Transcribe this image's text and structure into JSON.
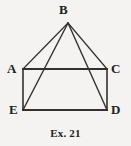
{
  "figure": {
    "caption": "Ex. 21",
    "background_color": "#f4f3f1",
    "stroke_color": "#33302e",
    "label_color": "#201e1d",
    "width": 131,
    "height": 146,
    "vertices": [
      {
        "id": "B",
        "label": "B",
        "x": 68,
        "y": 23
      },
      {
        "id": "A",
        "label": "A",
        "x": 23,
        "y": 69
      },
      {
        "id": "C",
        "label": "C",
        "x": 107,
        "y": 69
      },
      {
        "id": "E",
        "label": "E",
        "x": 23,
        "y": 110
      },
      {
        "id": "D",
        "label": "D",
        "x": 107,
        "y": 110
      }
    ],
    "segments": [
      {
        "id": "AC",
        "from": "A",
        "to": "C",
        "role": "rectangle-top-edge",
        "weight": 2.0
      },
      {
        "id": "CD",
        "from": "C",
        "to": "D",
        "role": "rectangle-right-edge",
        "weight": 1.6
      },
      {
        "id": "DE",
        "from": "D",
        "to": "E",
        "role": "rectangle-bottom-edge",
        "weight": 2.0
      },
      {
        "id": "EA",
        "from": "E",
        "to": "A",
        "role": "rectangle-left-edge",
        "weight": 1.6
      },
      {
        "id": "BA",
        "from": "B",
        "to": "A",
        "role": "apex-ray",
        "weight": 1.2
      },
      {
        "id": "BC",
        "from": "B",
        "to": "C",
        "role": "apex-ray",
        "weight": 1.2
      },
      {
        "id": "BE",
        "from": "B",
        "to": "E",
        "role": "apex-diagonal",
        "weight": 1.4
      },
      {
        "id": "BD",
        "from": "B",
        "to": "D",
        "role": "apex-diagonal",
        "weight": 1.4
      }
    ]
  }
}
